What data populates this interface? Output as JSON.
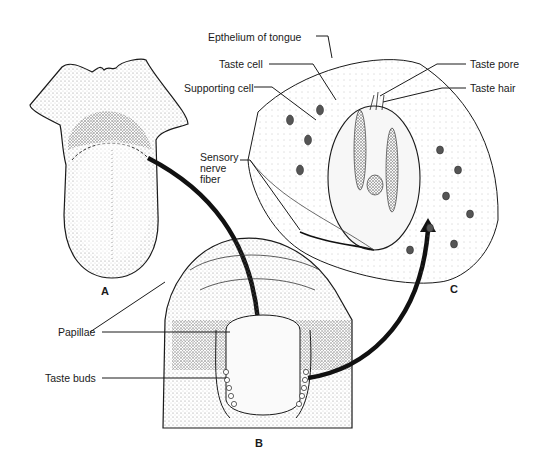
{
  "figure": {
    "panels": {
      "a": "A",
      "b": "B",
      "c": "C"
    },
    "labels": {
      "epithelium": "Epthelium of tongue",
      "taste_cell": "Taste cell",
      "supporting_cell": "Supporting cell",
      "sensory_nerve_1": "Sensory",
      "sensory_nerve_2": "nerve",
      "sensory_nerve_3": "fiber",
      "taste_pore": "Taste pore",
      "taste_hair": "Taste hair",
      "papillae": "Papillae",
      "taste_buds": "Taste buds"
    },
    "colors": {
      "ink": "#1a1a1a",
      "stipple": "#9a9a9a",
      "background": "#ffffff"
    }
  }
}
